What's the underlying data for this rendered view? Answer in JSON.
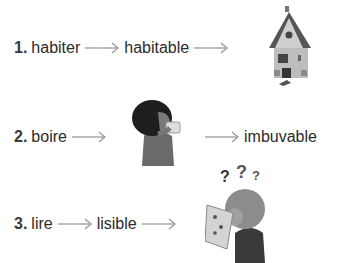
{
  "items": [
    {
      "number": "1.",
      "word": "habiter",
      "derived": "habitable",
      "image": "house-icon"
    },
    {
      "number": "2.",
      "word": "boire",
      "derived": "imbuvable",
      "image": "child-drinking-icon"
    },
    {
      "number": "3.",
      "word": "lire",
      "derived": "lisible",
      "image": "child-reading-confused-icon",
      "question_marks": "? ? ?"
    }
  ]
}
